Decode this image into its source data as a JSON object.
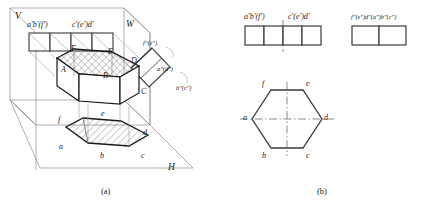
{
  "figure": {
    "captions": [
      {
        "label": "(a)",
        "x": 101,
        "y": 188
      },
      {
        "label": "(b)",
        "x": 317,
        "y": 188
      }
    ]
  },
  "pictorial": {
    "plane_labels": [
      {
        "name": "V",
        "text": "V",
        "x": 15,
        "y": 12
      },
      {
        "name": "W",
        "text": "W",
        "x": 126,
        "y": 20
      },
      {
        "name": "H",
        "text": "H",
        "x": 168,
        "y": 168
      }
    ],
    "solid_vertices": [
      {
        "name": "A",
        "text": "A",
        "x": 61,
        "y": 71
      },
      {
        "name": "B",
        "text": "B",
        "x": 103,
        "y": 77
      },
      {
        "name": "C",
        "text": "C",
        "x": 141,
        "y": 93
      },
      {
        "name": "D",
        "text": "D",
        "x": 131,
        "y": 62
      },
      {
        "name": "E",
        "text": "E",
        "x": 108,
        "y": 53
      },
      {
        "name": "F",
        "text": "F",
        "x": 71,
        "y": 50
      }
    ],
    "h_plane_vertices": [
      {
        "name": "a",
        "text": "a",
        "x": 59,
        "y": 148
      },
      {
        "name": "b",
        "text": "b",
        "x": 100,
        "y": 157
      },
      {
        "name": "c",
        "text": "c",
        "x": 141,
        "y": 157
      },
      {
        "name": "d",
        "text": "d",
        "x": 143,
        "y": 134
      },
      {
        "name": "e",
        "text": "e",
        "x": 101,
        "y": 115
      },
      {
        "name": "f",
        "text": "f",
        "x": 58,
        "y": 121
      }
    ],
    "v_plane_projections": [
      {
        "name": "a-b-f-front",
        "text": "a'b'(f')",
        "x": 28,
        "y": 25
      },
      {
        "name": "c-e-d-front",
        "text": "c'(e')d'",
        "x": 73,
        "y": 25
      }
    ],
    "w_plane_projections": [
      {
        "name": "f-e-side",
        "text": "f\"(e\")",
        "x": 146,
        "y": 44
      },
      {
        "name": "a-d-side",
        "text": "a\"(d\")",
        "x": 164,
        "y": 70
      },
      {
        "name": "b-c-side",
        "text": "b\"(c\")",
        "x": 182,
        "y": 89
      }
    ]
  },
  "orthographic": {
    "front_view": {
      "name": "front-view",
      "labels": [
        {
          "name": "front-left-label",
          "text": "a'b'(f')",
          "x": 247,
          "y": 16
        },
        {
          "name": "front-right-label",
          "text": "c'(e')d'",
          "x": 290,
          "y": 16
        }
      ]
    },
    "side_view": {
      "name": "side-view",
      "labels": [
        {
          "name": "side-label",
          "text": "f\"(e\")d\"(a\")b\"(c\")",
          "x": 352,
          "y": 16
        }
      ]
    },
    "top_view": {
      "name": "top-view-hexagon",
      "labels": [
        {
          "name": "hex-vertex-f",
          "text": "f",
          "x": 262,
          "y": 85
        },
        {
          "name": "hex-vertex-e",
          "text": "e",
          "x": 306,
          "y": 85
        },
        {
          "name": "hex-vertex-a",
          "text": "a",
          "x": 243,
          "y": 122
        },
        {
          "name": "hex-vertex-d",
          "text": "d",
          "x": 324,
          "y": 122
        },
        {
          "name": "hex-vertex-b",
          "text": "b",
          "x": 262,
          "y": 158
        },
        {
          "name": "hex-vertex-c",
          "text": "c",
          "x": 306,
          "y": 158
        }
      ]
    }
  }
}
